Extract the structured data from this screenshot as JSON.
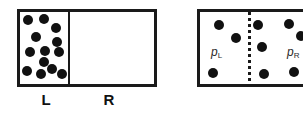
{
  "figure": {
    "background_color": "#ffffff",
    "border_color": "#1a1a1a",
    "particle_color": "#111111",
    "label_color": "#111111"
  },
  "panels": [
    {
      "id": "panel-before",
      "name": "left-panel-all-gas-in-L",
      "box": {
        "x": 17,
        "y": 9,
        "width": 140,
        "height": 78
      },
      "partition": {
        "style": "solid",
        "x": 68,
        "name": "solid-partition"
      },
      "chamber_labels": [
        {
          "text": "L",
          "x": 46,
          "y": 92
        },
        {
          "text": "R",
          "x": 109,
          "y": 92
        }
      ],
      "pressure_labels": [],
      "particles": [
        {
          "cx": 28,
          "cy": 20,
          "r": 5
        },
        {
          "cx": 44,
          "cy": 19,
          "r": 5
        },
        {
          "cx": 56,
          "cy": 28,
          "r": 5
        },
        {
          "cx": 36,
          "cy": 37,
          "r": 5
        },
        {
          "cx": 57,
          "cy": 42,
          "r": 5
        },
        {
          "cx": 30,
          "cy": 52,
          "r": 5
        },
        {
          "cx": 45,
          "cy": 51,
          "r": 5
        },
        {
          "cx": 59,
          "cy": 52,
          "r": 5
        },
        {
          "cx": 44,
          "cy": 62,
          "r": 5
        },
        {
          "cx": 27,
          "cy": 71,
          "r": 5
        },
        {
          "cx": 41,
          "cy": 74,
          "r": 5
        },
        {
          "cx": 52,
          "cy": 69,
          "r": 5
        },
        {
          "cx": 62,
          "cy": 74,
          "r": 5
        }
      ],
      "particle_count_left": 13,
      "particle_count_right": 0
    },
    {
      "id": "panel-after",
      "name": "right-panel-gas-mixed",
      "box": {
        "x": 197,
        "y": 9,
        "width": 125,
        "height": 78
      },
      "partition": {
        "style": "dotted",
        "x": 248,
        "name": "dotted-partition"
      },
      "chamber_labels": [],
      "pressure_labels": [
        {
          "symbol": "p",
          "subscript": "L",
          "x": 211,
          "y": 46
        },
        {
          "symbol": "p",
          "subscript": "R",
          "x": 287,
          "y": 46
        }
      ],
      "particles": [
        {
          "cx": 219,
          "cy": 25,
          "r": 5
        },
        {
          "cx": 236,
          "cy": 38,
          "r": 5
        },
        {
          "cx": 213,
          "cy": 73,
          "r": 5
        },
        {
          "cx": 258,
          "cy": 25,
          "r": 5
        },
        {
          "cx": 262,
          "cy": 47,
          "r": 5
        },
        {
          "cx": 264,
          "cy": 74,
          "r": 5
        },
        {
          "cx": 289,
          "cy": 24,
          "r": 5
        },
        {
          "cx": 301,
          "cy": 36,
          "r": 5
        },
        {
          "cx": 294,
          "cy": 72,
          "r": 5
        }
      ],
      "particle_count_left": 3,
      "particle_count_right": 6
    }
  ]
}
